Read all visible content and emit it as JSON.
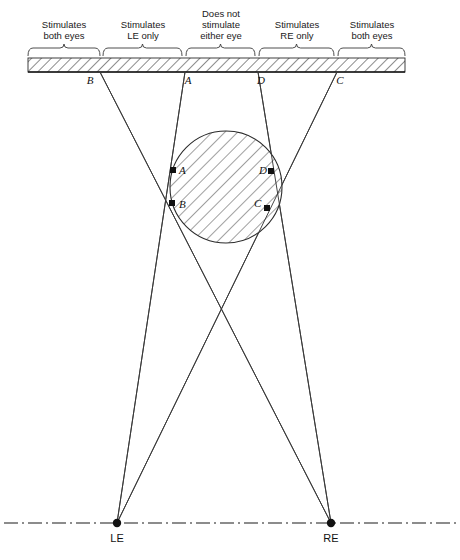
{
  "figure": {
    "background": "#ffffff",
    "line_color": "#3a3a3a",
    "text_color": "#1a1a1a"
  },
  "zones": [
    {
      "id": "zone-1",
      "line1": "Stimulates",
      "line2": "both eyes",
      "line3": "",
      "x_start": 28,
      "x_end": 100,
      "label_cx": 64
    },
    {
      "id": "zone-2",
      "line1": "Stimulates",
      "line2": "LE only",
      "line3": "",
      "x_start": 103,
      "x_end": 182,
      "label_cx": 143
    },
    {
      "id": "zone-3",
      "line1": "Does not",
      "line2": "stimulate",
      "line3": "either eye",
      "x_start": 186,
      "x_end": 255,
      "label_cx": 221
    },
    {
      "id": "zone-4",
      "line1": "Stimulates",
      "line2": "RE only",
      "line3": "",
      "x_start": 259,
      "x_end": 334,
      "label_cx": 297
    },
    {
      "id": "zone-5",
      "line1": "Stimulates",
      "line2": "both eyes",
      "line3": "",
      "x_start": 338,
      "x_end": 405,
      "label_cx": 372
    }
  ],
  "bar": {
    "x": 28,
    "y": 58,
    "width": 377,
    "height": 14,
    "baseline_y": 72
  },
  "screen_points": [
    {
      "name": "B",
      "x": 100,
      "y": 72,
      "label_x": 90,
      "label_y": 84
    },
    {
      "name": "A",
      "x": 185,
      "y": 72,
      "label_x": 188,
      "label_y": 84
    },
    {
      "name": "D",
      "x": 258,
      "y": 72,
      "label_x": 261,
      "label_y": 84
    },
    {
      "name": "C",
      "x": 337,
      "y": 72,
      "label_x": 340,
      "label_y": 84
    }
  ],
  "occluder": {
    "shape": "circle",
    "cx": 226,
    "cy": 187,
    "r": 56,
    "fill": "hatched"
  },
  "occluder_points": [
    {
      "name": "A",
      "x": 173,
      "y": 170,
      "label_x": 179,
      "label_y": 174
    },
    {
      "name": "B",
      "x": 172,
      "y": 203,
      "label_x": 179,
      "label_y": 208
    },
    {
      "name": "D",
      "x": 271,
      "y": 171,
      "label_x": 259,
      "label_y": 174
    },
    {
      "name": "C",
      "x": 267,
      "y": 208,
      "label_x": 254,
      "label_y": 207
    }
  ],
  "eyes": [
    {
      "name": "LE",
      "x": 117,
      "y": 523,
      "label_x": 117,
      "label_y": 542
    },
    {
      "name": "RE",
      "x": 331,
      "y": 523,
      "label_x": 331,
      "label_y": 542
    }
  ],
  "sight_lines": [
    {
      "id": "LE-to-A",
      "from": "LE",
      "x1": 117,
      "y1": 523,
      "x2": 185,
      "y2": 72
    },
    {
      "id": "LE-to-C",
      "from": "LE",
      "x1": 117,
      "y1": 523,
      "x2": 337,
      "y2": 72
    },
    {
      "id": "RE-to-B",
      "from": "RE",
      "x1": 331,
      "y1": 523,
      "x2": 100,
      "y2": 72
    },
    {
      "id": "RE-to-D",
      "from": "RE",
      "x1": 331,
      "y1": 523,
      "x2": 258,
      "y2": 72
    }
  ],
  "interocular_axis": {
    "y": 523,
    "x_start": 4,
    "x_end": 456,
    "style": "dash-dot"
  }
}
